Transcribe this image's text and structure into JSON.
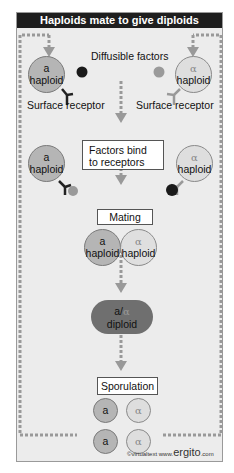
{
  "title": "Haploids mate to give diploids",
  "labels": {
    "diffusible_factors": "Diffusible factors",
    "surface_receptor_left": "Surface receptor",
    "surface_receptor_right": "Surface receptor"
  },
  "steps": {
    "factors_bind_line1": "Factors bind",
    "factors_bind_line2": "to receptors",
    "mating": "Mating",
    "sporulation": "Sporulation"
  },
  "cells": {
    "a_type": "a",
    "alpha_type": "α",
    "haploid": "haploid",
    "diploid_prefix": "a/",
    "diploid_alpha": "α",
    "diploid": "diploid"
  },
  "spores": [
    "a",
    "α",
    "a",
    "α"
  ],
  "credit": {
    "copyright": "©virtualtext",
    "site_prefix": "www.",
    "site_name": "ergito",
    "site_suffix": ".com"
  },
  "colors": {
    "title_bg": "#1e1e1e",
    "frame_bg": "#ececec",
    "arrow": "#999999",
    "a_cell": "#b5b5b5",
    "alpha_cell": "#dedede",
    "a_factor": "#1a1a1a",
    "alpha_factor": "#9a9a9a",
    "diploid": "#6f6f6f"
  }
}
